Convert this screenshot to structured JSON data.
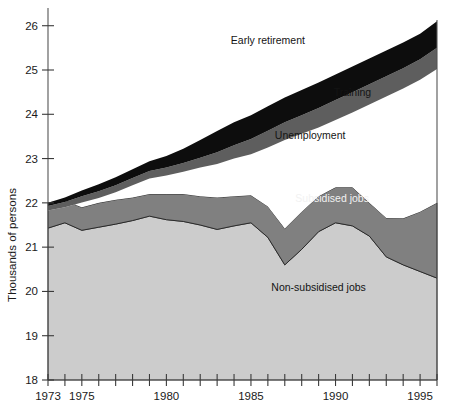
{
  "chart_data": {
    "type": "area",
    "stacked": true,
    "title": "",
    "subtitle": "",
    "xlabel": "",
    "ylabel": "Thousands of persons",
    "xlim": [
      1973,
      1996
    ],
    "ylim": [
      18,
      26.4
    ],
    "yticks": [
      18,
      19,
      20,
      21,
      22,
      23,
      24,
      25,
      26
    ],
    "ytick_labels": [
      "18",
      "19",
      "20",
      "21",
      "22",
      "23",
      "24",
      "25",
      "26"
    ],
    "xticks": [
      1973,
      1974,
      1975,
      1976,
      1977,
      1978,
      1979,
      1980,
      1981,
      1982,
      1983,
      1984,
      1985,
      1986,
      1987,
      1988,
      1989,
      1990,
      1991,
      1992,
      1993,
      1994,
      1995,
      1996
    ],
    "xtick_labels_shown": [
      "1973",
      "1975",
      "1980",
      "1985",
      "1990",
      "1995"
    ],
    "xtick_labels_values": [
      1973,
      1975,
      1980,
      1985,
      1990,
      1995
    ],
    "grid": false,
    "legend_position": "inline-annotations",
    "x": [
      1973,
      1974,
      1975,
      1976,
      1977,
      1978,
      1979,
      1980,
      1981,
      1982,
      1983,
      1984,
      1985,
      1986,
      1987,
      1988,
      1989,
      1990,
      1991,
      1992,
      1993,
      1994,
      1995,
      1996
    ],
    "series": [
      {
        "name": "Non-subsidised jobs",
        "color": "#cccccc",
        "label_color": "#141414",
        "values": [
          21.43,
          21.55,
          21.38,
          21.45,
          21.52,
          21.6,
          21.7,
          21.62,
          21.58,
          21.5,
          21.4,
          21.48,
          21.55,
          21.22,
          20.6,
          20.95,
          21.35,
          21.55,
          21.48,
          21.25,
          20.78,
          20.6,
          20.45,
          20.3
        ]
      },
      {
        "name": "Subsidised jobs",
        "color": "#808080",
        "label_color": "#f2f2f2",
        "values": [
          0.57,
          0.5,
          0.52,
          0.55,
          0.55,
          0.52,
          0.5,
          0.58,
          0.62,
          0.65,
          0.72,
          0.67,
          0.62,
          0.7,
          0.82,
          0.85,
          0.8,
          0.8,
          0.87,
          0.75,
          0.88,
          1.05,
          1.35,
          1.7
        ]
      },
      {
        "name": "Unemployment",
        "color": "#ffffff",
        "label_color": "#141414",
        "values": [
          0.0,
          0.0,
          0.0,
          0.0,
          0.0,
          0.0,
          0.0,
          0.0,
          0.0,
          0.0,
          0.0,
          0.0,
          0.0,
          0.0,
          0.0,
          0.0,
          0.0,
          0.0,
          0.0,
          0.0,
          0.0,
          0.0,
          0.0,
          0.0
        ]
      },
      {
        "name": "Training",
        "color": "#5e5e5e",
        "label_color": "#141414",
        "values": [
          0.1,
          0.12,
          0.14,
          0.15,
          0.16,
          0.16,
          0.17,
          0.18,
          0.2,
          0.22,
          0.26,
          0.3,
          0.34,
          0.38,
          0.4,
          0.42,
          0.44,
          0.45,
          0.46,
          0.46,
          0.46,
          0.46,
          0.46,
          0.48
        ]
      },
      {
        "name": "Early retirement",
        "color": "#0d0d0d",
        "label_color": "#141414",
        "values": [
          0.07,
          0.1,
          0.13,
          0.16,
          0.18,
          0.2,
          0.22,
          0.26,
          0.32,
          0.4,
          0.48,
          0.52,
          0.54,
          0.55,
          0.56,
          0.57,
          0.58,
          0.58,
          0.58,
          0.58,
          0.58,
          0.58,
          0.58,
          0.6
        ]
      }
    ],
    "total_top": [
      22.0,
      22.12,
      22.28,
      22.42,
      22.58,
      22.76,
      22.94,
      23.06,
      23.22,
      23.42,
      23.62,
      23.82,
      23.98,
      24.18,
      24.38,
      24.55,
      24.72,
      24.9,
      25.08,
      25.26,
      25.44,
      25.62,
      25.82,
      26.1
    ],
    "annotations": [
      {
        "text": "Early retirement",
        "x_value": 1986.0,
        "y_value": 25.58,
        "color": "#141414"
      },
      {
        "text": "Training",
        "x_value": 1991.0,
        "y_value": 24.42,
        "color": "#141414"
      },
      {
        "text": "Unemployment",
        "x_value": 1988.5,
        "y_value": 23.45,
        "color": "#141414"
      },
      {
        "text": "Subsidised jobs",
        "x_value": 1989.8,
        "y_value": 22.03,
        "color": "#f2f2f2"
      },
      {
        "text": "Non-subsidised jobs",
        "x_value": 1989.0,
        "y_value": 20.02,
        "color": "#141414"
      }
    ],
    "colors": {
      "non_subsidised_jobs": "#cccccc",
      "subsidised_jobs": "#808080",
      "unemployment": "#ffffff",
      "training": "#5e5e5e",
      "early_retirement": "#0d0d0d",
      "axis": "#555555",
      "text": "#1a1a1a",
      "background": "#ffffff"
    }
  }
}
